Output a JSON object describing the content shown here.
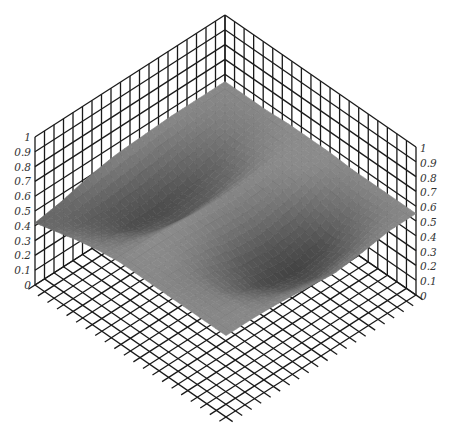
{
  "chart_data": {
    "type": "surface3d",
    "title": "",
    "xlabel": "",
    "ylabel": "",
    "zlabel": "",
    "zlim": [
      0,
      1
    ],
    "z_ticks": [
      "0",
      "0.1",
      "0.2",
      "0.3",
      "0.4",
      "0.5",
      "0.6",
      "0.7",
      "0.8",
      "0.9",
      "1"
    ],
    "grid": true,
    "grid_divisions": {
      "x": 20,
      "y": 20,
      "z": 10
    },
    "colormap": "gray",
    "surface_description": "Mostly flat plane near z≈0.55 with two elongated depressions (minima ≈0.3–0.35), one on the left-front half and one on the right-back half, separated by a raised ridge; small bumps near the back.",
    "surface_z_grid_approx": [
      [
        0.55,
        0.55,
        0.55,
        0.56,
        0.56,
        0.56,
        0.55,
        0.55,
        0.55,
        0.55
      ],
      [
        0.55,
        0.52,
        0.5,
        0.53,
        0.56,
        0.55,
        0.48,
        0.44,
        0.48,
        0.55
      ],
      [
        0.55,
        0.48,
        0.42,
        0.45,
        0.55,
        0.5,
        0.4,
        0.33,
        0.4,
        0.52
      ],
      [
        0.54,
        0.44,
        0.36,
        0.4,
        0.54,
        0.47,
        0.36,
        0.3,
        0.36,
        0.5
      ],
      [
        0.53,
        0.4,
        0.33,
        0.38,
        0.55,
        0.48,
        0.38,
        0.33,
        0.4,
        0.52
      ],
      [
        0.5,
        0.38,
        0.34,
        0.42,
        0.56,
        0.52,
        0.45,
        0.42,
        0.47,
        0.54
      ],
      [
        0.45,
        0.4,
        0.42,
        0.48,
        0.56,
        0.55,
        0.52,
        0.52,
        0.54,
        0.55
      ],
      [
        0.42,
        0.46,
        0.5,
        0.53,
        0.55,
        0.55,
        0.55,
        0.55,
        0.55,
        0.55
      ]
    ]
  },
  "axes": {
    "left_ticks": [
      "0",
      "0.1",
      "0.2",
      "0.3",
      "0.4",
      "0.5",
      "0.6",
      "0.7",
      "0.8",
      "0.9",
      "1"
    ],
    "right_ticks": [
      "0",
      "0.1",
      "0.2",
      "0.3",
      "0.4",
      "0.5",
      "0.6",
      "0.7",
      "0.8",
      "0.9",
      "1"
    ]
  },
  "colors": {
    "grid": "#1a1a1a",
    "surface_light": "#8e8e8e",
    "surface_mid": "#6f6f6f",
    "surface_dark": "#3f3f3f",
    "background": "#ffffff"
  }
}
